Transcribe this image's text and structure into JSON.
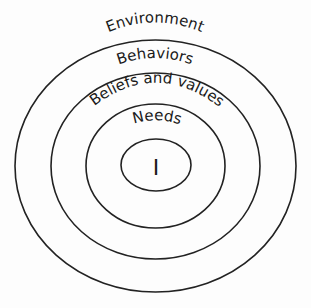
{
  "diagram": {
    "type": "concentric-layers",
    "line_color": "#222222",
    "text_color": "#1a1a1a",
    "background": "#fdfdfd",
    "layers": [
      {
        "id": "environment",
        "label": "Environment",
        "level": 1
      },
      {
        "id": "behaviors",
        "label": "Behaviors",
        "level": 2
      },
      {
        "id": "beliefs-and-values",
        "label": "Beliefs and values",
        "level": 3
      },
      {
        "id": "needs",
        "label": "Needs",
        "level": 4
      },
      {
        "id": "self",
        "label": "I",
        "level": 5
      }
    ]
  }
}
